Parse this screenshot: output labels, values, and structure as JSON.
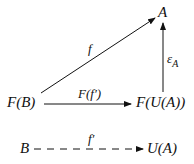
{
  "diagram": {
    "type": "commutative-diagram",
    "nodes": {
      "A": "A",
      "FB": "F(B)",
      "FUA": "F(U(A))",
      "B": "B",
      "UA": "U(A)"
    },
    "arrows": {
      "f": {
        "label": "f",
        "from": "F(B)",
        "to": "A",
        "style": "solid"
      },
      "epsilon": {
        "label": "ε",
        "subscript": "A",
        "from": "F(U(A))",
        "to": "A",
        "style": "solid"
      },
      "Ff": {
        "label": "F(f′)",
        "from": "F(B)",
        "to": "F(U(A))",
        "style": "solid"
      },
      "fprime": {
        "label": "f′",
        "from": "B",
        "to": "U(A)",
        "style": "dashed"
      }
    }
  }
}
